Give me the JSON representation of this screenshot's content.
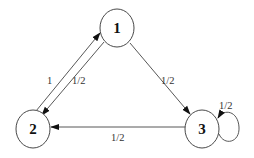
{
  "diagram": {
    "type": "markov-chain",
    "nodes": [
      {
        "id": "1",
        "label": "1"
      },
      {
        "id": "2",
        "label": "2"
      },
      {
        "id": "3",
        "label": "3"
      }
    ],
    "edges": [
      {
        "from": "2",
        "to": "1",
        "label": "1"
      },
      {
        "from": "1",
        "to": "2",
        "label": "1/2"
      },
      {
        "from": "1",
        "to": "3",
        "label": "1/2"
      },
      {
        "from": "3",
        "to": "2",
        "label": "1/2"
      },
      {
        "from": "3",
        "to": "3",
        "label": "1/2"
      }
    ]
  }
}
